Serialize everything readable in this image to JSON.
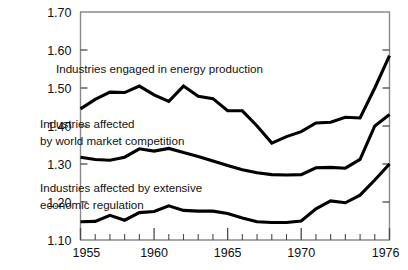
{
  "chart_data": {
    "type": "line",
    "title": "",
    "subtitle": "",
    "xlabel": "",
    "ylabel": "",
    "xlim": [
      1955,
      1976
    ],
    "ylim": [
      1.1,
      1.7
    ],
    "grid": false,
    "legend_position": "inline-annotations",
    "x": [
      1955,
      1956,
      1957,
      1958,
      1959,
      1960,
      1961,
      1962,
      1963,
      1964,
      1965,
      1966,
      1967,
      1968,
      1969,
      1970,
      1971,
      1972,
      1973,
      1974,
      1975,
      1976
    ],
    "y_ticks": [
      "1.70",
      "1.60",
      "1.50",
      "1.40",
      "1.30",
      "1.20",
      "1.10"
    ],
    "y_tick_values": [
      1.7,
      1.6,
      1.5,
      1.4,
      1.3,
      1.2,
      1.1
    ],
    "x_ticks": [
      "1955",
      "1960",
      "1965",
      "1970",
      "1976"
    ],
    "x_tick_values": [
      1955,
      1960,
      1965,
      1970,
      1976
    ],
    "x_minor_step": 1,
    "series": [
      {
        "name": "Industries engaged in energy production",
        "label_line1": "Industries engaged in energy production",
        "color": "#000000",
        "values": [
          1.445,
          1.47,
          1.489,
          1.488,
          1.505,
          1.482,
          1.465,
          1.505,
          1.478,
          1.472,
          1.44,
          1.44,
          1.4,
          1.355,
          1.372,
          1.385,
          1.408,
          1.41,
          1.423,
          1.421,
          1.5,
          1.585
        ]
      },
      {
        "name": "Industries affected by world market competition",
        "label_line1": "Industries affected",
        "label_line2": "by world  market  competition",
        "color": "#000000",
        "values": [
          1.318,
          1.312,
          1.31,
          1.318,
          1.34,
          1.334,
          1.341,
          1.33,
          1.32,
          1.308,
          1.296,
          1.285,
          1.277,
          1.272,
          1.271,
          1.272,
          1.29,
          1.291,
          1.289,
          1.312,
          1.4,
          1.43
        ]
      },
      {
        "name": "Industries affected by extensive economic regulation",
        "label_line1": "Industries affected by extensive",
        "label_line2": "economic regulation",
        "color": "#000000",
        "values": [
          1.148,
          1.149,
          1.165,
          1.152,
          1.172,
          1.175,
          1.19,
          1.178,
          1.176,
          1.176,
          1.17,
          1.158,
          1.148,
          1.146,
          1.146,
          1.15,
          1.182,
          1.203,
          1.198,
          1.218,
          1.258,
          1.3
        ]
      }
    ],
    "annotations": [
      {
        "text": "Industries engaged in energy production",
        "x_px": 56,
        "y_px": 73
      },
      {
        "text": "Industries affected",
        "x_px": 40,
        "y_px": 128
      },
      {
        "text": "by world  market  competition",
        "x_px": 40,
        "y_px": 145
      },
      {
        "text": "Industries affected by extensive",
        "x_px": 40,
        "y_px": 192
      },
      {
        "text": "economic regulation",
        "x_px": 40,
        "y_px": 209
      }
    ]
  },
  "axis": {
    "frame_color": "#8a8a8a",
    "tick_color": "#5a5a5a",
    "line_color": "#000000"
  }
}
